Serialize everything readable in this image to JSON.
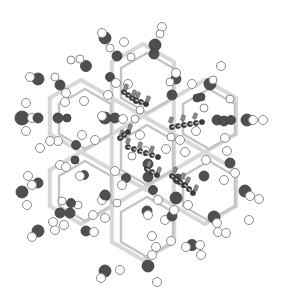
{
  "figure": {
    "type": "ball-and-stick molecular structure",
    "colors": {
      "background": "#ffffff",
      "framework_atom_dark": "#4f4f4f",
      "framework_atom_light": "#ffffff",
      "bond": "#d8d8d8",
      "guest_atom_dark": "#3d3d3d",
      "guest_atom_light": "#8c8c8c"
    },
    "legend": [],
    "labels": []
  }
}
